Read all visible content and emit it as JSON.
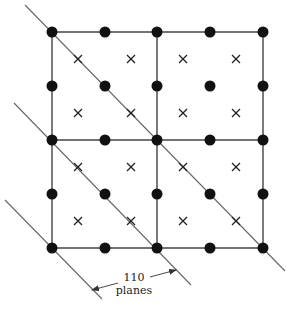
{
  "figure": {
    "colors": {
      "atom": "#111111",
      "cell_line": "#444444",
      "plane_line": "#666666",
      "cross": "#222222",
      "background": "#ffffff"
    },
    "grid": {
      "columns_x": [
        52,
        105,
        157,
        210,
        263
      ],
      "rows_y": [
        32,
        86,
        140,
        194,
        248
      ]
    },
    "cell_lines": [
      {
        "x1": 52,
        "y1": 32,
        "x2": 263,
        "y2": 32
      },
      {
        "x1": 52,
        "y1": 140,
        "x2": 263,
        "y2": 140
      },
      {
        "x1": 52,
        "y1": 248,
        "x2": 263,
        "y2": 248
      },
      {
        "x1": 52,
        "y1": 32,
        "x2": 52,
        "y2": 248
      },
      {
        "x1": 157,
        "y1": 32,
        "x2": 157,
        "y2": 248
      },
      {
        "x1": 263,
        "y1": 32,
        "x2": 263,
        "y2": 248
      }
    ],
    "atoms": [
      [
        52,
        32
      ],
      [
        105,
        32
      ],
      [
        157,
        32
      ],
      [
        210,
        32
      ],
      [
        263,
        32
      ],
      [
        52,
        86
      ],
      [
        105,
        86
      ],
      [
        157,
        86
      ],
      [
        210,
        86
      ],
      [
        263,
        86
      ],
      [
        52,
        140
      ],
      [
        105,
        140
      ],
      [
        157,
        140
      ],
      [
        210,
        140
      ],
      [
        263,
        140
      ],
      [
        52,
        194
      ],
      [
        105,
        194
      ],
      [
        157,
        194
      ],
      [
        210,
        194
      ],
      [
        263,
        194
      ],
      [
        52,
        248
      ],
      [
        105,
        248
      ],
      [
        157,
        248
      ],
      [
        210,
        248
      ],
      [
        263,
        248
      ]
    ],
    "crosses": [
      [
        78,
        59
      ],
      [
        131,
        59
      ],
      [
        183,
        59
      ],
      [
        236,
        59
      ],
      [
        78,
        113
      ],
      [
        131,
        113
      ],
      [
        183,
        113
      ],
      [
        236,
        113
      ],
      [
        78,
        167
      ],
      [
        131,
        167
      ],
      [
        183,
        167
      ],
      [
        236,
        167
      ],
      [
        78,
        221
      ],
      [
        131,
        221
      ],
      [
        183,
        221
      ],
      [
        236,
        221
      ]
    ],
    "planes": [
      {
        "name": "plane-1",
        "x1": 25,
        "y1": 5,
        "x2": 285,
        "y2": 271
      },
      {
        "name": "plane-2",
        "x1": 14,
        "y1": 103,
        "x2": 191,
        "y2": 285
      },
      {
        "name": "plane-3",
        "x1": 5,
        "y1": 200,
        "x2": 102,
        "y2": 299
      }
    ],
    "arrows": [
      {
        "name": "arrow-to-plane-3",
        "x1": 118,
        "y1": 283,
        "x2": 92,
        "y2": 290
      },
      {
        "name": "arrow-to-plane-2",
        "x1": 150,
        "y1": 277,
        "x2": 176,
        "y2": 270
      }
    ],
    "label": {
      "line1": "110",
      "line2": "planes"
    }
  }
}
